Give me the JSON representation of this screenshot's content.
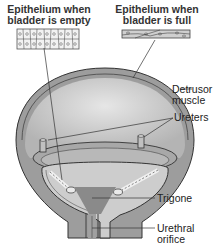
{
  "diagram": {
    "type": "anatomical",
    "insets": [
      {
        "id": "empty",
        "title_line1": "Epithelium when",
        "title_line2": "bladder is empty"
      },
      {
        "id": "full",
        "title_line1": "Epithelium when",
        "title_line2": "bladder is full"
      }
    ],
    "labels": {
      "detrusor_line1": "Detrusor",
      "detrusor_line2": "muscle",
      "ureters": "Ureters",
      "trigone": "Trigone",
      "urethral_line1": "Urethral",
      "urethral_line2": "orifice"
    },
    "colors": {
      "outer_wall": "#9a9a9a",
      "inner_cavity": "#c8c8c8",
      "trigone": "#8a8a8a",
      "outline": "#333333"
    }
  }
}
